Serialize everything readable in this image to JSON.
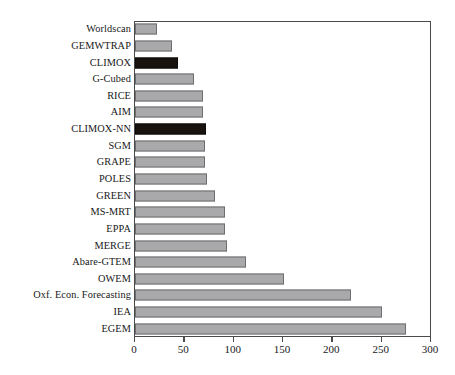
{
  "chart_data": {
    "type": "bar",
    "orientation": "horizontal",
    "title": "",
    "subtitle": "",
    "xlabel": "",
    "ylabel": "",
    "xlim": [
      0,
      300
    ],
    "ylim": null,
    "xticks": [
      0,
      50,
      100,
      150,
      200,
      250,
      300
    ],
    "xticklabels": [
      "0",
      "50",
      "100",
      "150",
      "200",
      "250",
      "300"
    ],
    "grid": false,
    "legend": null,
    "legend_position": "none",
    "frame": true,
    "categories": [
      "Worldscan",
      "GEMWTRAP",
      "CLIMOX",
      "G-Cubed",
      "RICE",
      "AIM",
      "CLIMOX-NN",
      "SGM",
      "GRAPE",
      "POLES",
      "GREEN",
      "MS-MRT",
      "EPPA",
      "MERGE",
      "Abare-GTEM",
      "OWEM",
      "Oxf. Econ. Forecasting",
      "IEA",
      "EGEM"
    ],
    "values": [
      22,
      37,
      44,
      60,
      69,
      69,
      72,
      71,
      71,
      73,
      81,
      91,
      91,
      93,
      112,
      151,
      219,
      250,
      275
    ],
    "highlighted": [
      "CLIMOX",
      "CLIMOX-NN"
    ],
    "colors": {
      "bar_fill": "#a9a9ac",
      "bar_edge": "#6e6e70",
      "highlight_fill": "#191310",
      "highlight_edge": "#0d0a08",
      "axis": "#4a4a4a",
      "text": "#181818",
      "background": "#ffffff"
    }
  },
  "caption": {
    "text": ""
  }
}
